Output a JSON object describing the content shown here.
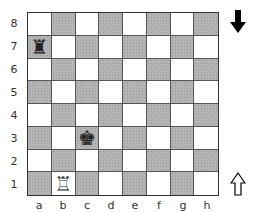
{
  "board": {
    "ranks": [
      "8",
      "7",
      "6",
      "5",
      "4",
      "3",
      "2",
      "1"
    ],
    "files": [
      "a",
      "b",
      "c",
      "d",
      "e",
      "f",
      "g",
      "h"
    ],
    "light_color": "#ffffff",
    "dark_color": "#b4b4b4",
    "pieces": [
      {
        "square": "a7",
        "type": "rook",
        "color": "black",
        "glyph": "♜"
      },
      {
        "square": "c3",
        "type": "king",
        "color": "black",
        "glyph": "♚"
      },
      {
        "square": "b1",
        "type": "rook",
        "color": "white",
        "glyph": "♖"
      }
    ]
  },
  "indicators": {
    "black_side": {
      "icon": "arrow-down-filled-icon",
      "glyph": "⬇"
    },
    "white_side": {
      "icon": "arrow-up-outline-icon",
      "glyph": "⇧"
    }
  }
}
